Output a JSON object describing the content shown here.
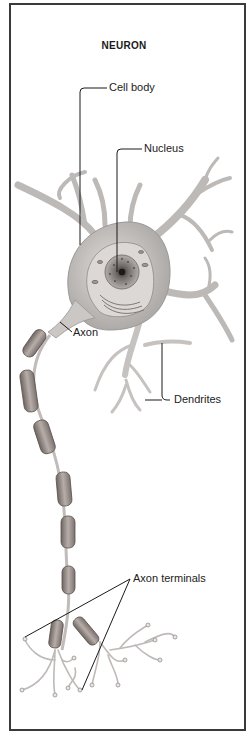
{
  "diagram": {
    "title": "NEURON",
    "labels": {
      "cell_body": "Cell body",
      "nucleus": "Nucleus",
      "axon": "Axon",
      "dendrites": "Dendrites",
      "axon_terminals": "Axon terminals"
    },
    "colors": {
      "background": "#ffffff",
      "border": "#3a3a3a",
      "cell_fill": "#c9c6c4",
      "cell_shade": "#a8a4a2",
      "nucleus": "#7a7472",
      "myelin": "#9a8f8b",
      "leader_line": "#1a1a1a"
    }
  }
}
